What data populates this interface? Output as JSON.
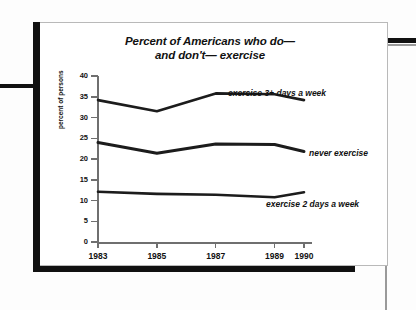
{
  "title_line1": "Percent of Americans who do—",
  "title_line2": "and don't— exercise",
  "chart_data": {
    "type": "line",
    "title": "Percent of Americans who do— and don't— exercise",
    "xlabel": "",
    "ylabel": "percent of persons",
    "categories": [
      "1983",
      "1985",
      "1987",
      "1989",
      "1990"
    ],
    "x": [
      1983,
      1985,
      1987,
      1989,
      1990
    ],
    "ylim": [
      0,
      40
    ],
    "yticks": [
      0,
      5,
      10,
      15,
      20,
      25,
      30,
      35,
      40
    ],
    "grid": false,
    "legend_position": "inline-right",
    "series": [
      {
        "name": "exercise 3+ days a week",
        "values": [
          34.2,
          31.5,
          35.8,
          35.6,
          34.2
        ],
        "color": "#1c1c1c"
      },
      {
        "name": "never exercise",
        "values": [
          24.0,
          21.4,
          23.6,
          23.5,
          21.8
        ],
        "color": "#1c1c1c"
      },
      {
        "name": "exercise 2 days a week",
        "values": [
          12.1,
          11.6,
          11.4,
          10.8,
          12.0
        ],
        "color": "#1c1c1c"
      }
    ]
  },
  "axis": {
    "y_tick_labels": [
      "40",
      "35",
      "30",
      "25",
      "20",
      "15",
      "10",
      "5",
      "0"
    ],
    "x_tick_labels": [
      "1983",
      "1985",
      "1987",
      "1989",
      "1990"
    ],
    "y_axis_title": "percent of persons"
  }
}
